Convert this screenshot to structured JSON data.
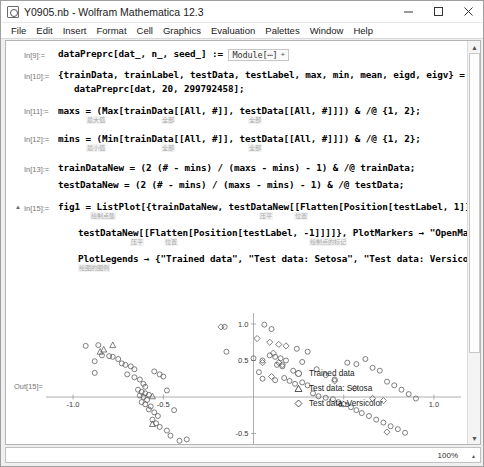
{
  "window": {
    "title": "Y0905.nb - Wolfram Mathematica 12.3",
    "app_icon": "mathematica-icon",
    "minimize": "–",
    "maximize": "□",
    "close": "✕"
  },
  "menubar": {
    "items": [
      {
        "label": "File"
      },
      {
        "label": "Edit"
      },
      {
        "label": "Insert"
      },
      {
        "label": "Format"
      },
      {
        "label": "Cell"
      },
      {
        "label": "Graphics"
      },
      {
        "label": "Evaluation"
      },
      {
        "label": "Palettes"
      },
      {
        "label": "Window"
      },
      {
        "label": "Help"
      }
    ]
  },
  "notebook": {
    "cells": [
      {
        "in_label": "In[9]:=",
        "lines": [
          "dataPreprc[dat_, n_, seed_] := "
        ],
        "module_chip": "Module[⋯]",
        "chip_plus": "+",
        "hints": []
      },
      {
        "in_label": "In[10]:=",
        "lines": [
          "{trainData, trainLabel, testData, testLabel, max, min, mean, eigd, eigv} =",
          "dataPreprc[dat, 20, 299792458];"
        ],
        "hints": []
      },
      {
        "in_label": "In[11]:=",
        "lines": [
          "maxs = (Max[trainData[[All, #]], testData[[All, #]]]) & /@ {1, 2};"
        ],
        "hints": [
          "最大值",
          "全部",
          "全部"
        ]
      },
      {
        "in_label": "In[12]:=",
        "lines": [
          "mins = (Min[trainData[[All, #]], testData[[All, #]]]) & /@ {1, 2};"
        ],
        "hints": [
          "最小值",
          "全部",
          "全部"
        ]
      },
      {
        "in_label": "In[13]:=",
        "lines": [
          "trainDataNew = (2 (# - mins) / (maxs - mins) - 1) & /@ trainData;",
          "testDataNew = (2 (# - mins) / (maxs - mins) - 1) & /@ testData;"
        ],
        "hints": []
      },
      {
        "in_label": "In[15]:=",
        "lines": [
          "fig1 = ListPlot[{trainDataNew, testDataNew[[Flatten[Position[testLabel, 1]]]],",
          "testDataNew[[Flatten[Position[testLabel, -1]]]]}, PlotMarkers → \"OpenMarkers\",",
          "PlotLegends → {\"Trained data\", \"Test data: Setosa\", \"Test data: Versicolor\"}]"
        ],
        "hints": [
          "绘制点集",
          "压平",
          "位置",
          "压平",
          "位置",
          "绘制点的标记",
          "绘图的图例"
        ]
      }
    ],
    "out_label": "Out[15]="
  },
  "chart_data": {
    "type": "scatter",
    "title": "",
    "xlabel": "",
    "ylabel": "",
    "xlim": [
      -1.15,
      1.15
    ],
    "ylim": [
      -1.15,
      1.15
    ],
    "grid": false,
    "axes": "cross",
    "xticks": [
      -1.0,
      -0.5,
      0.5,
      1.0
    ],
    "xticklabels": [
      "-1.0",
      "-0.5",
      "0.5",
      "1.0"
    ],
    "yticks": [
      -1.0,
      -0.5,
      0.5,
      1.0
    ],
    "yticklabels": [
      "-1.0",
      "-0.5",
      "0.5",
      "1.0"
    ],
    "legend_position": "right",
    "series": [
      {
        "name": "Trained data",
        "marker": "open-circle",
        "color": "#555555",
        "points": [
          [
            -0.93,
            0.7
          ],
          [
            -0.86,
            0.71
          ],
          [
            -0.88,
            0.49
          ],
          [
            -0.84,
            0.57
          ],
          [
            -0.8,
            0.56
          ],
          [
            -0.78,
            0.55
          ],
          [
            -0.75,
            0.52
          ],
          [
            -0.73,
            0.46
          ],
          [
            -0.71,
            0.44
          ],
          [
            -0.68,
            0.42
          ],
          [
            -0.66,
            0.38
          ],
          [
            -0.7,
            0.31
          ],
          [
            -0.66,
            0.27
          ],
          [
            -0.63,
            0.24
          ],
          [
            -0.61,
            0.18
          ],
          [
            -0.6,
            0.14
          ],
          [
            -0.64,
            0.1
          ],
          [
            -0.62,
            0.07
          ],
          [
            -0.6,
            0.05
          ],
          [
            -0.63,
            0.02
          ],
          [
            -0.61,
            0.0
          ],
          [
            -0.58,
            0.03
          ],
          [
            -0.59,
            -0.04
          ],
          [
            -0.62,
            -0.07
          ],
          [
            -0.6,
            -0.1
          ],
          [
            -0.57,
            -0.13
          ],
          [
            -0.58,
            -0.17
          ],
          [
            -0.55,
            -0.21
          ],
          [
            -0.53,
            -0.26
          ],
          [
            -0.56,
            -0.31
          ],
          [
            -0.54,
            -0.36
          ],
          [
            -0.52,
            -0.41
          ],
          [
            -0.48,
            -0.46
          ],
          [
            -0.46,
            -0.53
          ],
          [
            -0.41,
            -0.6
          ],
          [
            -0.37,
            -0.58
          ],
          [
            -0.44,
            -0.18
          ],
          [
            -0.48,
            0.09
          ],
          [
            -0.5,
            0.28
          ],
          [
            -0.88,
            0.33
          ],
          [
            -0.55,
            0.35
          ],
          [
            -0.52,
            0.31
          ],
          [
            -0.16,
            0.96
          ],
          [
            -0.15,
            0.62
          ],
          [
            0.06,
            0.99
          ],
          [
            0.1,
            0.93
          ],
          [
            0.0,
            0.53
          ],
          [
            0.05,
            0.5
          ],
          [
            0.09,
            0.57
          ],
          [
            0.12,
            0.55
          ],
          [
            0.15,
            0.53
          ],
          [
            0.18,
            0.5
          ],
          [
            0.13,
            0.44
          ],
          [
            0.16,
            0.42
          ],
          [
            0.03,
            0.34
          ],
          [
            0.05,
            0.25
          ],
          [
            0.12,
            0.23
          ],
          [
            0.17,
            0.26
          ],
          [
            0.2,
            0.22
          ],
          [
            0.23,
            0.18
          ],
          [
            0.27,
            0.2
          ],
          [
            0.3,
            0.16
          ],
          [
            0.33,
            0.05
          ],
          [
            0.36,
            0.01
          ],
          [
            0.4,
            -0.01
          ],
          [
            0.44,
            -0.03
          ],
          [
            0.47,
            -0.07
          ],
          [
            0.5,
            -0.1
          ],
          [
            0.54,
            -0.14
          ],
          [
            0.57,
            -0.18
          ],
          [
            0.6,
            -0.22
          ],
          [
            0.64,
            -0.26
          ],
          [
            0.68,
            -0.31
          ],
          [
            0.72,
            -0.35
          ],
          [
            0.76,
            -0.4
          ],
          [
            0.8,
            -0.44
          ],
          [
            0.84,
            -0.49
          ],
          [
            0.52,
            0.47
          ],
          [
            0.57,
            0.45
          ],
          [
            0.62,
            0.52
          ],
          [
            0.66,
            0.4
          ],
          [
            0.7,
            0.36
          ],
          [
            0.74,
            0.21
          ],
          [
            0.78,
            0.16
          ],
          [
            0.82,
            0.1
          ],
          [
            0.86,
            0.04
          ],
          [
            0.9,
            -0.02
          ],
          [
            0.45,
            0.24
          ],
          [
            0.4,
            0.3
          ],
          [
            0.35,
            0.38
          ],
          [
            0.27,
            0.48
          ],
          [
            0.22,
            0.36
          ],
          [
            0.3,
            0.62
          ],
          [
            0.24,
            0.66
          ]
        ]
      },
      {
        "name": "Test data: Setosa",
        "marker": "open-triangle",
        "color": "#555555",
        "points": [
          [
            -0.78,
            0.71
          ],
          [
            -0.85,
            0.62
          ],
          [
            -0.56,
            0.01
          ],
          [
            -0.56,
            -0.37
          ],
          [
            -0.6,
            -0.72
          ],
          [
            -0.83,
            0.65
          ]
        ]
      },
      {
        "name": "Test data: Versicolor",
        "marker": "open-diamond",
        "color": "#555555",
        "points": [
          [
            -0.18,
            0.96
          ],
          [
            0.02,
            0.8
          ],
          [
            0.09,
            0.75
          ],
          [
            0.14,
            0.72
          ],
          [
            0.18,
            0.7
          ],
          [
            0.11,
            0.6
          ],
          [
            0.05,
            0.47
          ],
          [
            0.14,
            0.47
          ],
          [
            0.16,
            0.44
          ],
          [
            0.1,
            0.28
          ],
          [
            0.45,
            0.22
          ],
          [
            0.56,
            0.12
          ],
          [
            0.66,
            -0.02
          ],
          [
            0.72,
            -0.05
          ],
          [
            0.74,
            -0.48
          ]
        ]
      }
    ]
  },
  "legend": {
    "entries": [
      {
        "marker": "open-circle",
        "label": "Trained data"
      },
      {
        "marker": "open-triangle",
        "label": "Test data: Setosa"
      },
      {
        "marker": "open-diamond",
        "label": "Test data: Versicolor"
      }
    ]
  },
  "statusbar": {
    "zoom": "100%",
    "caret": "▴"
  }
}
